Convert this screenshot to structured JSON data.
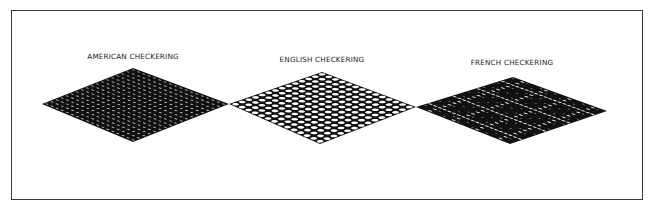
{
  "figure": {
    "panels": [
      {
        "id": "american",
        "label": "AMERICAN CHECKERING",
        "label_pos": [
          133,
          52
        ],
        "diamond": {
          "top": [
            133,
            68
          ],
          "left": [
            42,
            104
          ],
          "right": [
            229,
            104
          ],
          "bottom": [
            133,
            142
          ]
        },
        "pattern": "dense-dark"
      },
      {
        "id": "english",
        "label": "ENGLISH CHECKERING",
        "label_pos": [
          322,
          55
        ],
        "diamond": {
          "top": [
            322,
            72
          ],
          "left": [
            229,
            104
          ],
          "right": [
            416,
            107
          ],
          "bottom": [
            320,
            144
          ]
        },
        "pattern": "open-grid"
      },
      {
        "id": "french",
        "label": "FRENCH CHECKERING",
        "label_pos": [
          512,
          58
        ],
        "diamond": {
          "top": [
            513,
            77
          ],
          "left": [
            416,
            107
          ],
          "right": [
            607,
            111
          ],
          "bottom": [
            510,
            144
          ]
        },
        "pattern": "dark-with-skipped-lines"
      }
    ],
    "colors": {
      "ink": "#111111",
      "paper": "#ffffff",
      "frame": "#3a3a3a"
    }
  }
}
